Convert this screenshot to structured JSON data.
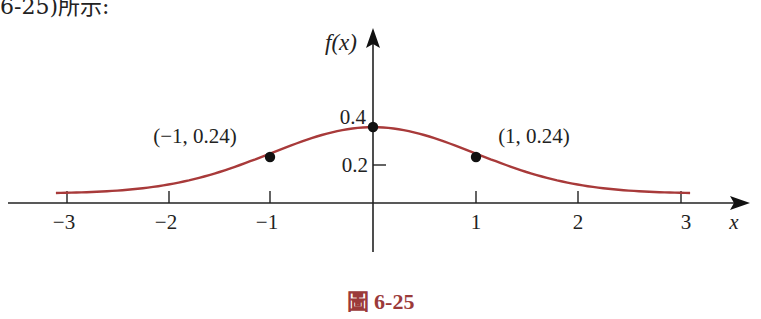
{
  "page": {
    "top_fragment": "6-25)所示:",
    "caption": "圖 6-25",
    "colors": {
      "curve": "#a83a3a",
      "axes": "#222222",
      "points": "#111111",
      "caption": "#9b3a3a"
    }
  },
  "chart_data": {
    "type": "line",
    "title": "",
    "function_label": "f(x)",
    "xlabel": "x",
    "ylabel": "f(x)",
    "xlim": [
      -3.1,
      3.1
    ],
    "ylim": [
      0,
      0.45
    ],
    "grid": false,
    "x_ticks": [
      -3,
      -2,
      -1,
      1,
      2,
      3
    ],
    "x_tick_labels": [
      "−3",
      "−2",
      "−1",
      "1",
      "2",
      "3"
    ],
    "y_ticks": [
      0.2,
      0.4
    ],
    "y_tick_labels": [
      "0.2",
      "0.4"
    ],
    "series": [
      {
        "name": "standard normal density",
        "x": [
          -3,
          -2.5,
          -2,
          -1.5,
          -1,
          -0.5,
          0,
          0.5,
          1,
          1.5,
          2,
          2.5,
          3
        ],
        "values": [
          0.004,
          0.018,
          0.054,
          0.13,
          0.242,
          0.352,
          0.399,
          0.352,
          0.242,
          0.13,
          0.054,
          0.018,
          0.004
        ]
      }
    ],
    "marked_points": [
      {
        "x": -1,
        "y": 0.24,
        "label": "(−1, 0.24)"
      },
      {
        "x": 0,
        "y": 0.4,
        "label": ""
      },
      {
        "x": 1,
        "y": 0.24,
        "label": "(1, 0.24)"
      }
    ]
  }
}
